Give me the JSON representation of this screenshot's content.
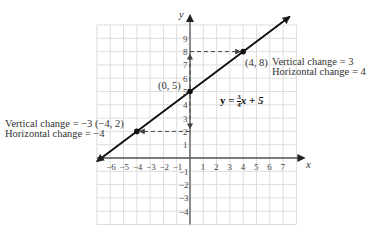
{
  "graph": {
    "axes": {
      "x_label": "x",
      "y_label": "y"
    },
    "x_ticks": [
      "-6",
      "-5",
      "-4",
      "-3",
      "-2",
      "-1",
      "1",
      "2",
      "3",
      "4",
      "5",
      "6",
      "7"
    ],
    "y_ticks": [
      "9",
      "8",
      "7",
      "6",
      "5",
      "4",
      "3",
      "2",
      "1",
      "-1",
      "-2",
      "-3",
      "-4"
    ],
    "equation": {
      "lhs": "y = ",
      "num": "3",
      "den": "4",
      "rhs": "x + 5"
    },
    "points": [
      {
        "label": "(0, 5)",
        "x": 0,
        "y": 5
      },
      {
        "label": "(4, 8)",
        "x": 4,
        "y": 8
      },
      {
        "label": "(-4, 2)",
        "x": -4,
        "y": 2
      }
    ],
    "right_annotation": {
      "vertical": "Vertical change = 3",
      "horizontal": "Horizontal change = 4"
    },
    "left_annotation": {
      "vertical": "Vertical change = −3",
      "point": "(−4, 2)",
      "horizontal": "Horizontal change = −4"
    }
  },
  "chart_data": {
    "type": "line",
    "title": "",
    "xlabel": "x",
    "ylabel": "y",
    "xlim": [
      -7,
      8
    ],
    "ylim": [
      -5,
      10
    ],
    "grid": true,
    "series": [
      {
        "name": "y = 3/4 x + 5",
        "x": [
          -7,
          7.5
        ],
        "y": [
          -0.25,
          10.625
        ]
      }
    ],
    "points": [
      {
        "x": 0,
        "y": 5
      },
      {
        "x": 4,
        "y": 8
      },
      {
        "x": -4,
        "y": 2
      }
    ],
    "annotations": [
      "(0, 5)",
      "(4, 8) Vertical change = 3, Horizontal change = 4",
      "(-4, 2) Vertical change = -3, Horizontal change = -4"
    ]
  }
}
